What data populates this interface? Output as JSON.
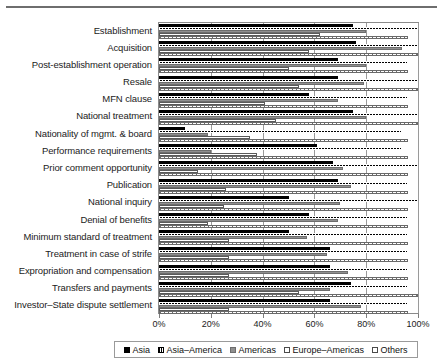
{
  "chart_data": {
    "type": "bar",
    "orientation": "horizontal",
    "title": "",
    "xlabel": "",
    "ylabel": "",
    "xlim": [
      0,
      100
    ],
    "xticks": [
      "0%",
      "20%",
      "40%",
      "60%",
      "80%",
      "100%"
    ],
    "xtick_values": [
      0,
      20,
      40,
      60,
      80,
      100
    ],
    "grid": true,
    "legend_position": "bottom",
    "categories": [
      "Establishment",
      "Acquisition",
      "Post-establishment operation",
      "Resale",
      "MFN clause",
      "National treatment",
      "Nationality of mgmt. & board",
      "Performance requirements",
      "Prior comment opportunity",
      "Publication",
      "National inquiry",
      "Denial of benefits",
      "Minimum standard of treatment",
      "Treatment in case of strife",
      "Expropriation and compensation",
      "Transfers and payments",
      "Investor–State dispute settlement"
    ],
    "series": [
      {
        "name": "Asia",
        "color": "#000000",
        "values": [
          75,
          76,
          69,
          69,
          58,
          75,
          10,
          61,
          67,
          69,
          50,
          58,
          50,
          66,
          66,
          74,
          66
        ]
      },
      {
        "name": "Asia–America",
        "color": "#000000",
        "values": [
          100,
          100,
          96,
          100,
          96,
          100,
          94,
          94,
          100,
          96,
          100,
          96,
          96,
          96,
          96,
          96,
          96
        ]
      },
      {
        "name": "Americas",
        "color": "#8f8f8f",
        "values": [
          80,
          94,
          80,
          79,
          69,
          80,
          19,
          20,
          71,
          74,
          70,
          69,
          57,
          65,
          73,
          66,
          78
        ]
      },
      {
        "name": "Europe–Americas",
        "color": "#ffffff",
        "values": [
          62,
          58,
          50,
          54,
          41,
          45,
          35,
          38,
          15,
          26,
          25,
          19,
          27,
          27,
          27,
          54,
          27
        ]
      },
      {
        "name": "Others",
        "color": "#ffffff",
        "values": [
          96,
          100,
          96,
          100,
          96,
          100,
          96,
          96,
          96,
          96,
          96,
          96,
          96,
          96,
          96,
          100,
          96
        ]
      }
    ]
  },
  "legend": {
    "items": [
      {
        "label": "Asia",
        "swatch": "legend-swatch-asia"
      },
      {
        "label": "Asia–America",
        "swatch": "legend-swatch-asia-america"
      },
      {
        "label": "Americas",
        "swatch": "legend-swatch-americas"
      },
      {
        "label": "Europe–Americas",
        "swatch": "legend-swatch-europe-americas"
      },
      {
        "label": "Others",
        "swatch": "legend-swatch-others"
      }
    ]
  }
}
